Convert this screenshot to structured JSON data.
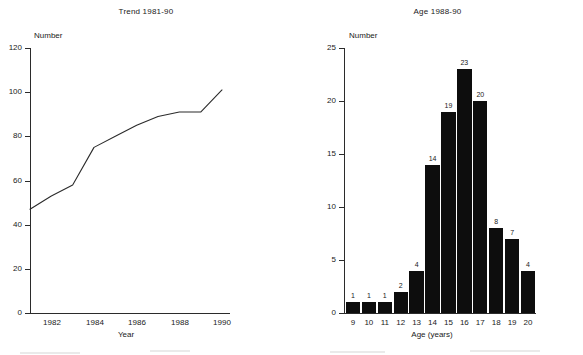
{
  "figure": {
    "width": 583,
    "height": 355,
    "background": "#ffffff",
    "ink_color": "#1a1a1a",
    "bar_color": "#0d0d0d"
  },
  "chart_data": [
    {
      "type": "line",
      "title": "Trend 1981-90",
      "xlabel": "Year",
      "ylabel": "Number",
      "x": [
        1981,
        1982,
        1983,
        1984,
        1985,
        1986,
        1987,
        1988,
        1989,
        1990
      ],
      "values": [
        47,
        53,
        58,
        75,
        80,
        85,
        89,
        91,
        91,
        101
      ],
      "xlim": [
        1981,
        1990
      ],
      "ylim": [
        0,
        120
      ],
      "xticks": [
        1982,
        1984,
        1986,
        1988,
        1990
      ],
      "xtick_labels": [
        "1982",
        "1984",
        "1986",
        "1988",
        "1990"
      ],
      "yticks": [
        0,
        20,
        40,
        60,
        80,
        100,
        120
      ],
      "ytick_labels": [
        "0",
        "20",
        "40",
        "60",
        "80",
        "100",
        "120"
      ],
      "grid": false,
      "legend": false
    },
    {
      "type": "bar",
      "title": "Age 1988-90",
      "xlabel": "Age (years)",
      "ylabel": "Number",
      "categories": [
        "9",
        "10",
        "11",
        "12",
        "13",
        "14",
        "15",
        "16",
        "17",
        "18",
        "19",
        "20"
      ],
      "values": [
        1,
        1,
        1,
        2,
        4,
        14,
        19,
        23,
        20,
        8,
        7,
        4
      ],
      "data_labels": [
        "1",
        "1",
        "1",
        "2",
        "4",
        "14",
        "19",
        "23",
        "20",
        "8",
        "7",
        "4"
      ],
      "ylim": [
        0,
        25
      ],
      "yticks": [
        0,
        5,
        10,
        15,
        20,
        25
      ],
      "ytick_labels": [
        "0",
        "5",
        "10",
        "15",
        "20",
        "25"
      ],
      "grid": false,
      "legend": false
    }
  ]
}
